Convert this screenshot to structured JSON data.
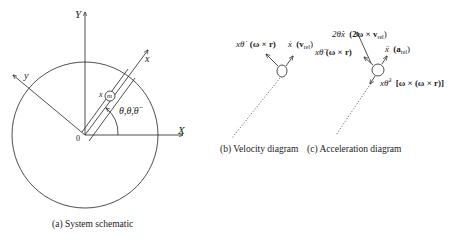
{
  "panels": {
    "a": {
      "caption": "(a) System schematic",
      "axis_X": "X",
      "axis_Y": "Y",
      "axis_x": "x",
      "axis_y": "y",
      "origin": "0",
      "mass_x_label": "x",
      "mass_label": "m",
      "angle_label": "θ,θ̇,θ̈"
    },
    "b": {
      "caption": "(b) Velocity diagram",
      "left_term": "xθ̇",
      "left_vec": "(ω × r)",
      "right_term": "ẋ",
      "right_vec": "(v",
      "right_sub": "rel",
      "right_close": ")"
    },
    "c": {
      "caption": "(c) Acceleration diagram",
      "top_term": "2θ̇ẋ",
      "top_vec": "(2ω × v",
      "top_sub": "rel",
      "top_close": ")",
      "left_term": "xθ̈",
      "left_vec": "(ω × r)",
      "right_term": "ẍ",
      "right_vec": "(a",
      "right_sub": "rel",
      "right_close": ")",
      "bottom_term": "xθ̇",
      "bottom_sup": "2",
      "bottom_vec": "[ω × (ω × r)]"
    }
  },
  "colors": {
    "stroke": "#222222",
    "background": "#ffffff"
  }
}
